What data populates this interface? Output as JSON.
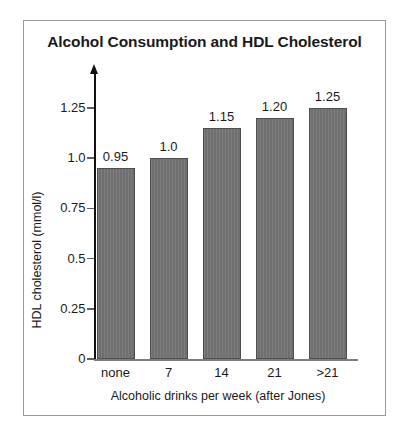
{
  "chart_data": {
    "type": "bar",
    "title": "Alcohol Consumption and HDL Cholesterol",
    "xlabel": "Alcoholic drinks per week (after Jones)",
    "ylabel": "HDL cholesterol (mmol/l)",
    "categories": [
      "none",
      "7",
      "14",
      "21",
      ">21"
    ],
    "values": [
      0.95,
      1.0,
      1.15,
      1.2,
      1.25
    ],
    "value_labels": [
      "0.95",
      "1.0",
      "1.15",
      "1.20",
      "1.25"
    ],
    "ylim": [
      0,
      1.32
    ],
    "yticks": [
      0,
      0.25,
      0.5,
      0.75,
      1.0,
      1.25
    ],
    "ytick_labels": [
      "0",
      "0.25",
      "0.5",
      "0.75",
      "1.0",
      "1.25"
    ],
    "grid": false,
    "legend": false,
    "bar_color": "#6f6f6f",
    "bar_edge_color": "#4e4e4e",
    "axis_color": "#111111",
    "frame_color": "#9a9a9a",
    "text_color": "#1a1a1a"
  }
}
